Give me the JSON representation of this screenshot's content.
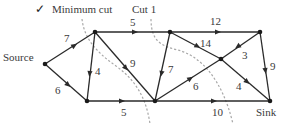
{
  "header": {
    "check_glyph": "✓",
    "min_cut_label": "Minimum cut",
    "cut1_label": "Cut 1"
  },
  "nodes": {
    "source": {
      "label": "Source",
      "x": 45,
      "y": 64
    },
    "a": {
      "x": 95,
      "y": 32
    },
    "b": {
      "x": 87,
      "y": 101
    },
    "c": {
      "x": 170,
      "y": 32
    },
    "d": {
      "x": 155,
      "y": 101
    },
    "e": {
      "x": 260,
      "y": 32
    },
    "f": {
      "x": 221,
      "y": 59
    },
    "sink": {
      "label": "Sink",
      "x": 270,
      "y": 101
    }
  },
  "edges": [
    {
      "from": "source",
      "to": "a",
      "capacity": "7"
    },
    {
      "from": "source",
      "to": "b",
      "capacity": "6"
    },
    {
      "from": "a",
      "to": "b",
      "capacity": "4"
    },
    {
      "from": "a",
      "to": "c",
      "capacity": "5"
    },
    {
      "from": "a",
      "to": "d",
      "capacity": "9"
    },
    {
      "from": "b",
      "to": "d",
      "capacity": "5"
    },
    {
      "from": "c",
      "to": "d",
      "capacity": "7"
    },
    {
      "from": "c",
      "to": "e",
      "capacity": "12"
    },
    {
      "from": "c",
      "to": "f",
      "capacity": "14"
    },
    {
      "from": "e",
      "to": "f",
      "capacity": "3"
    },
    {
      "from": "e",
      "to": "sink",
      "capacity": "9"
    },
    {
      "from": "d",
      "to": "f",
      "capacity": "6"
    },
    {
      "from": "f",
      "to": "sink",
      "capacity": "4"
    },
    {
      "from": "d",
      "to": "sink",
      "capacity": "10"
    }
  ],
  "colors": {
    "edge": "#2a2a2a",
    "cut_line": "#a8a8a8",
    "text": "#3a3a3a"
  }
}
